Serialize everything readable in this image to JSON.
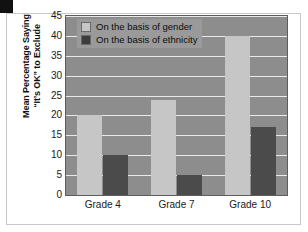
{
  "chart_data": {
    "type": "bar",
    "title": "",
    "subtitle": "",
    "xlabel": "",
    "ylabel": "Mean Percentage Saying \"It's OK\" to Exclude",
    "ylabel_lines": [
      "Mean Percentage Saying",
      "“It’s OK” to Exclude"
    ],
    "categories": [
      "Grade 4",
      "Grade 7",
      "Grade 10"
    ],
    "series": [
      {
        "name": "On the basis of gender",
        "values": [
          20,
          24,
          40
        ],
        "color": "#c6c6c6"
      },
      {
        "name": "On the basis of ethnicity",
        "values": [
          10,
          5,
          17
        ],
        "color": "#4b4b4b"
      }
    ],
    "ylim": [
      0,
      45
    ],
    "ytick_step": 5,
    "yticks": [
      0,
      5,
      10,
      15,
      20,
      25,
      30,
      35,
      40,
      45
    ],
    "ytick_labels": [
      "0",
      "5",
      "10",
      "15",
      "20",
      "25",
      "30",
      "35",
      "40",
      "45"
    ],
    "grid": true,
    "grid_axis": "y",
    "grid_color": "#e9e9e9",
    "legend_position": "upper left",
    "plot_background": "#8d8d8d",
    "figure_background": "#ffffff",
    "axis_color": "#5d5d5d"
  },
  "legend": {
    "items": [
      {
        "label": "On the basis of gender",
        "swatch": "gender"
      },
      {
        "label": "On the basis of ethnicity",
        "swatch": "ethnicity"
      }
    ]
  }
}
